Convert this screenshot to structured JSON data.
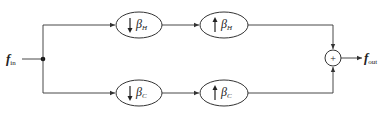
{
  "diagram": {
    "type": "block-diagram",
    "input": {
      "symbol": "f",
      "subscript": "in"
    },
    "output": {
      "symbol": "f",
      "subscript": "out"
    },
    "junction": {
      "type": "split-dot"
    },
    "summer": {
      "symbol": "+"
    },
    "paths": [
      {
        "name": "upper-path",
        "blocks": [
          {
            "operation": "downsample",
            "arrow": "↓",
            "symbol": "β",
            "subscript": "H"
          },
          {
            "operation": "upsample",
            "arrow": "↑",
            "symbol": "β",
            "subscript": "H"
          }
        ]
      },
      {
        "name": "lower-path",
        "blocks": [
          {
            "operation": "downsample",
            "arrow": "↓",
            "symbol": "β",
            "subscript": "C"
          },
          {
            "operation": "upsample",
            "arrow": "↑",
            "symbol": "β",
            "subscript": "C"
          }
        ]
      }
    ],
    "colors": {
      "stroke": "#333333",
      "text": "#222222",
      "background": "#ffffff"
    }
  }
}
